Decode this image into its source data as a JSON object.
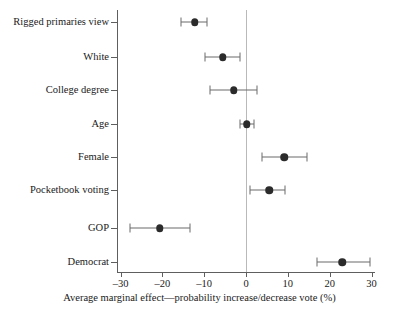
{
  "chart_data": {
    "type": "scatter",
    "title": "",
    "subtitle": "",
    "xlabel": "Average marginal effect—probability increase/decrease vote (%)",
    "ylabel": "",
    "xlim": [
      -30,
      30
    ],
    "xticks": [
      -30,
      -20,
      -10,
      0,
      10,
      20,
      30
    ],
    "xticklabels": [
      "–30",
      "–20",
      "–10",
      "0",
      "10",
      "20",
      "30"
    ],
    "grid": false,
    "legend": null,
    "reference_line": 0,
    "orientation": "horizontal",
    "categories": [
      "Rigged primaries view",
      "White",
      "College degree",
      "Age",
      "Female",
      "Pocketbook voting",
      "GOP",
      "Democrat"
    ],
    "points": [
      {
        "label": "Rigged primaries view",
        "estimate": -12.2,
        "ci_low": -15.5,
        "ci_high": -9.3
      },
      {
        "label": "White",
        "estimate": -5.5,
        "ci_low": -9.8,
        "ci_high": -1.4
      },
      {
        "label": "College degree",
        "estimate": -2.9,
        "ci_low": -8.6,
        "ci_high": 2.6
      },
      {
        "label": "Age",
        "estimate": 0.2,
        "ci_low": -1.4,
        "ci_high": 1.9
      },
      {
        "label": "Female",
        "estimate": 9.1,
        "ci_low": 3.8,
        "ci_high": 14.6
      },
      {
        "label": "Pocketbook voting",
        "estimate": 5.5,
        "ci_low": 1.0,
        "ci_high": 9.4
      },
      {
        "label": "GOP",
        "estimate": -20.6,
        "ci_low": -27.8,
        "ci_high": -13.4
      },
      {
        "label": "Democrat",
        "estimate": 23.0,
        "ci_low": 17.0,
        "ci_high": 29.7
      }
    ],
    "colors": {
      "marker": "#2b2b2b",
      "whisker": "#6b6b6b",
      "axis": "#5e5e5e",
      "reference_line": "#b9b9b9",
      "background": "#ffffff",
      "text": "#1a1a1a"
    }
  }
}
